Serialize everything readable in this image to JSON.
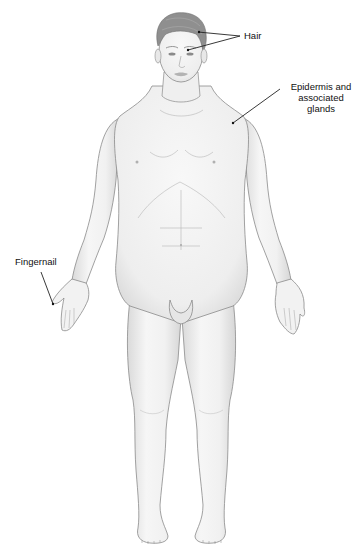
{
  "figure": {
    "colors": {
      "background": "#ffffff",
      "skin_fill": "#f3f3f3",
      "skin_shade": "#dcdcdc",
      "outline": "#8a8a8a",
      "hair": "#8c8c8c",
      "leader_line": "#222222",
      "label_text": "#111111"
    }
  },
  "labels": [
    {
      "id": "hair",
      "text": "Hair"
    },
    {
      "id": "epidermis",
      "lines": [
        "Epidermis and",
        "associated",
        "glands"
      ]
    },
    {
      "id": "fingernail",
      "text": "Fingernail"
    }
  ]
}
